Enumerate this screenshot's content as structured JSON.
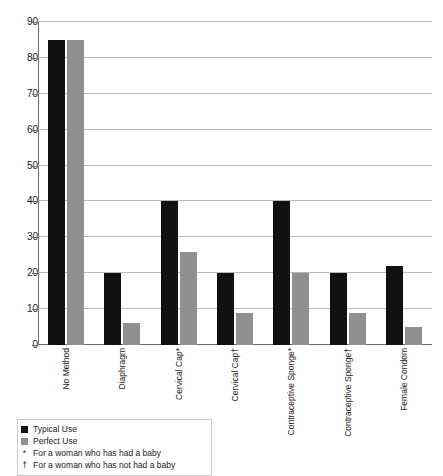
{
  "chart_data": {
    "type": "bar",
    "title": "",
    "subtitle": "",
    "xlabel": "",
    "ylabel": "",
    "ylim": [
      0,
      90
    ],
    "ytick_step": 10,
    "yticks": [
      0,
      10,
      20,
      30,
      40,
      50,
      60,
      70,
      80,
      90
    ],
    "grid": true,
    "legend_position": "bottom-left",
    "categories": [
      "No Method",
      "Diaphragm",
      "Cervical Cap*",
      "Cervical Cap†",
      "Contraceptive Sponge*",
      "Contraceptive Sponge†",
      "Female Condom"
    ],
    "series": [
      {
        "name": "Typical Use",
        "color": "#111111",
        "values": [
          85,
          20,
          40,
          20,
          40,
          20,
          22
        ]
      },
      {
        "name": "Perfect Use",
        "color": "#8f8f8f",
        "values": [
          85,
          6,
          26,
          9,
          20,
          9,
          5
        ]
      }
    ],
    "annotations": [
      {
        "symbol": "*",
        "text": "For a woman who has had a baby"
      },
      {
        "symbol": "†",
        "text": "For a woman who has not had a baby"
      }
    ]
  },
  "legend": {
    "entries": [
      {
        "symbol": "",
        "label": "Typical Use",
        "swatch": "typical"
      },
      {
        "symbol": "",
        "label": "Perfect Use",
        "swatch": "perfect"
      },
      {
        "symbol": "*",
        "label": "For a woman who has had a baby",
        "swatch": "none"
      },
      {
        "symbol": "†",
        "label": "For a woman who has not had a baby",
        "swatch": "none"
      }
    ]
  },
  "colors": {
    "typical_use": "#111111",
    "perfect_use": "#8f8f8f",
    "gridline": "#b8b8b8",
    "axis": "#6e6e6e",
    "background": "#ffffff"
  }
}
